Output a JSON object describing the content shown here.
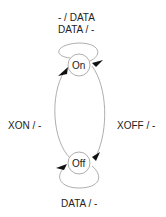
{
  "diagram": {
    "type": "state-machine",
    "states": [
      {
        "id": "on",
        "label": "On"
      },
      {
        "id": "off",
        "label": "Off"
      }
    ],
    "transitions": [
      {
        "from": "on",
        "to": "on",
        "label_line1": "- / DATA",
        "label_line2": "DATA / -"
      },
      {
        "from": "off",
        "to": "on",
        "label": "XON / -"
      },
      {
        "from": "on",
        "to": "off",
        "label": "XOFF / -"
      },
      {
        "from": "off",
        "to": "off",
        "label": "DATA / -"
      }
    ],
    "colors": {
      "stroke": "#999999",
      "arrow": "#111111",
      "text": "#222222"
    }
  }
}
